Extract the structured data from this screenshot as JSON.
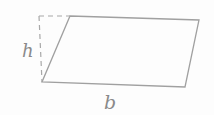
{
  "figure": {
    "labels": {
      "height": "h",
      "base": "b"
    },
    "colors": {
      "line": "#a0a0a0",
      "dashed_line": "#a8a8a8",
      "label": "#8a8a8a",
      "background": "#fdfdfd"
    }
  }
}
